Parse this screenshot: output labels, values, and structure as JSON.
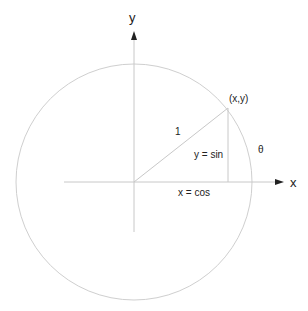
{
  "diagram": {
    "labels": {
      "y_axis": "y",
      "x_axis": "x",
      "point": "(x,y)",
      "radius": "1",
      "sin": "y = sin",
      "cos": "x = cos",
      "angle": "θ"
    },
    "colors": {
      "line": "#c8c8c8",
      "arrow": "#222222",
      "text": "#222222"
    }
  }
}
